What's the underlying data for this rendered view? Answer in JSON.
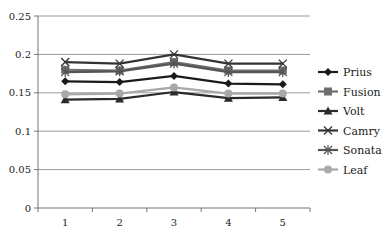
{
  "chart_data": {
    "type": "line",
    "title": "",
    "xlabel": "",
    "ylabel": "",
    "x": [
      1,
      2,
      3,
      4,
      5
    ],
    "categories": [
      "1",
      "2",
      "3",
      "4",
      "5"
    ],
    "ylim": [
      0,
      0.25
    ],
    "yticks": [
      0,
      0.05,
      0.1,
      0.15,
      0.2,
      0.25
    ],
    "ytick_labels": [
      "0",
      "0.05",
      "0.1",
      "0.15",
      "0.2",
      "0.25"
    ],
    "grid": true,
    "legend_position": "right",
    "series": [
      {
        "name": "Prius",
        "marker": "diamond",
        "color": "#1a1a1a",
        "values": [
          0.165,
          0.164,
          0.172,
          0.162,
          0.161
        ]
      },
      {
        "name": "Fusion",
        "marker": "square",
        "color": "#6e6e6e",
        "values": [
          0.18,
          0.179,
          0.19,
          0.179,
          0.179
        ]
      },
      {
        "name": "Volt",
        "marker": "triangle",
        "color": "#2a2a2a",
        "values": [
          0.141,
          0.142,
          0.151,
          0.143,
          0.144
        ]
      },
      {
        "name": "Camry",
        "marker": "x",
        "color": "#333333",
        "values": [
          0.19,
          0.188,
          0.2,
          0.188,
          0.188
        ]
      },
      {
        "name": "Sonata",
        "marker": "star",
        "color": "#555555",
        "values": [
          0.177,
          0.178,
          0.188,
          0.177,
          0.177
        ]
      },
      {
        "name": "Leaf",
        "marker": "circle",
        "color": "#a8a8a8",
        "values": [
          0.148,
          0.149,
          0.157,
          0.149,
          0.149
        ]
      }
    ]
  }
}
